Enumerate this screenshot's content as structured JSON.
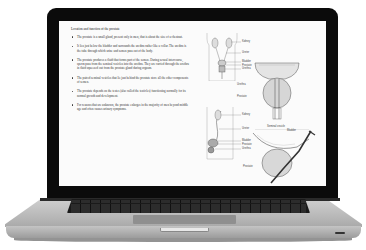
{
  "device": {
    "type": "laptop",
    "bezel_color": "#0b0b0b",
    "body_color": "#c0c0c0"
  },
  "document": {
    "title": "Location and function of the prostate",
    "bullets": [
      "The prostate is a small gland, present only in men, that is about the size of a chestnut.",
      "It lies just below the bladder and surrounds the urethra rather like a collar. The urethra is the tube through which urine and semen pass out of the body.",
      "The prostate produces a fluid that forms part of the semen. During sexual intercourse, sperm pass from the seminal vesicles into the urethra. They are carried through the urethra in fluid squeezed out from the prostate gland during orgasm.",
      "The paired seminal vesicles that lie just behind the prostate store all the other components of semen.",
      "The prostate depends on the testes (also called the testicles) functioning normally for its normal growth and development.",
      "For reasons that are unknown, the prostate enlarges in the majority of men beyond middle age and often causes urinary symptoms."
    ]
  },
  "figures": {
    "front_view": {
      "labels": [
        "Kidney",
        "Ureter",
        "Bladder",
        "Prostate",
        "Urethra"
      ]
    },
    "prostate_front": {
      "labels": [
        "Urethra",
        "Prostate"
      ]
    },
    "side_view": {
      "labels": [
        "Kidney",
        "Ureter",
        "Bladder",
        "Prostate",
        "Urethra"
      ]
    },
    "prostate_side": {
      "labels": [
        "Seminal vesicle",
        "Bladder",
        "Prostate"
      ]
    }
  }
}
